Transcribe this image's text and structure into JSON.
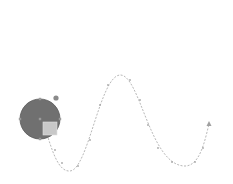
{
  "canvas": {
    "width": 233,
    "height": 184,
    "background": "#ffffff"
  },
  "motion_path": {
    "label": "sine-wave motion path",
    "stroke": "#b8b8b8",
    "path": "M45,128 C52,150 58,172 70,171 C88,170 100,76 120,75 C140,74 150,166 185,166 C200,166 205,140 209,124",
    "waypoints": [
      [
        55,
        150
      ],
      [
        62,
        163
      ],
      [
        78,
        166
      ],
      [
        90,
        140
      ],
      [
        100,
        105
      ],
      [
        108,
        85
      ],
      [
        130,
        80
      ],
      [
        140,
        100
      ],
      [
        148,
        125
      ],
      [
        158,
        148
      ],
      [
        172,
        162
      ],
      [
        195,
        162
      ],
      [
        203,
        148
      ]
    ],
    "end_arrow": {
      "x": 209,
      "y": 124
    }
  },
  "object": {
    "label": "selected circle shape",
    "cx": 40,
    "cy": 119,
    "r": 20,
    "fill": "#707070",
    "stroke": "#5a5a5a",
    "rotate_handle": {
      "x": 56,
      "y": 98,
      "color": "#8a8a8a"
    },
    "inset_square": {
      "x": 43,
      "y": 122,
      "w": 14,
      "h": 13,
      "fill": "#c8c8c8"
    },
    "handles_color": "#9a9a9a"
  }
}
